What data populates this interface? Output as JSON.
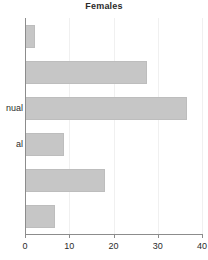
{
  "chart_data": {
    "type": "bar",
    "orientation": "horizontal",
    "title": "Females",
    "xlabel": "",
    "ylabel": "",
    "xlim": [
      0,
      40
    ],
    "xticks": [
      0,
      10,
      20,
      30,
      40
    ],
    "xtick_labels": [
      "0",
      "10",
      "20",
      "30",
      "40"
    ],
    "grid": true,
    "grid_axis": "x",
    "legend": false,
    "bar_color": "#c6c6c6",
    "bar_edge_color": "#bdbdbd",
    "axis_color": "#8c8c8c",
    "gridline_color": "#f0f0f0",
    "title_color": "#2b2b2b",
    "categories": [
      "",
      "",
      "nual",
      "al",
      "",
      ""
    ],
    "category_labels_truncated": true,
    "values": [
      2.2,
      27.5,
      36.6,
      8.8,
      18.1,
      6.8
    ],
    "bars": [
      {
        "index": 0,
        "label": "",
        "value": 2.2
      },
      {
        "index": 1,
        "label": "",
        "value": 27.5
      },
      {
        "index": 2,
        "label": "nual",
        "value": 36.6
      },
      {
        "index": 3,
        "label": "al",
        "value": 8.8
      },
      {
        "index": 4,
        "label": "",
        "value": 18.1
      },
      {
        "index": 5,
        "label": "",
        "value": 6.8
      }
    ]
  }
}
